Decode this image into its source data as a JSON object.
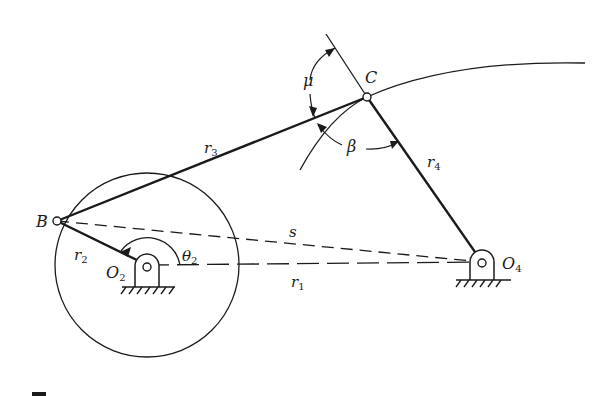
{
  "diagram": {
    "type": "four-bar linkage",
    "labels": {
      "B": "B",
      "C": "C",
      "O2": "O",
      "O2_sub": "2",
      "O4": "O",
      "O4_sub": "4",
      "r1": "r",
      "r1_sub": "1",
      "r2": "r",
      "r2_sub": "2",
      "r3": "r",
      "r3_sub": "3",
      "r4": "r",
      "r4_sub": "4",
      "s": "s",
      "theta2": "θ",
      "theta2_sub": "2",
      "mu": "μ",
      "beta": "β"
    },
    "colors": {
      "ink": "#1a1a1a",
      "background": "#ffffff"
    }
  }
}
